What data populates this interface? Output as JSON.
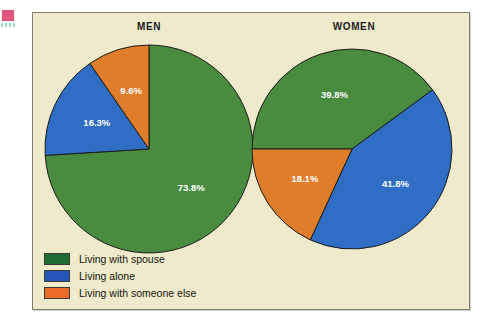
{
  "artifacts": {
    "pink_mark_color": "#e2567d",
    "teal_dash_color": "#93cfc4"
  },
  "panel": {
    "background_color": "#eeeacb",
    "border_color": "#7d7f72"
  },
  "colors": {
    "spouse_green": "#4a8c3f",
    "alone_blue": "#2f6ec4",
    "someone_else_orange": "#e07d2a",
    "legend_spouse_green": "#1e6b34",
    "legend_alone_blue": "#2356b8",
    "legend_someone_else_orange": "#ea6a2a",
    "slice_outline": "#1b1b1b",
    "label_text": "#ffffff"
  },
  "legend": {
    "items": [
      {
        "label": "Living with spouse",
        "color": "#1e6b34"
      },
      {
        "label": "Living alone",
        "color": "#2356b8"
      },
      {
        "label": "Living with someone else",
        "color": "#ea6a2a"
      }
    ]
  },
  "chart_data": [
    {
      "type": "pie",
      "title": "MEN",
      "categories": [
        "Living with spouse",
        "Living alone",
        "Living with someone else"
      ],
      "values": [
        73.8,
        16.3,
        9.6
      ],
      "labels": [
        "73.8%",
        "16.3%",
        "9.6%"
      ],
      "colors": [
        "#4a8c3f",
        "#2f6ec4",
        "#e07d2a"
      ],
      "start_angle_deg": 90,
      "direction": "clockwise",
      "units": "percent",
      "legend_position": "bottom-left"
    },
    {
      "type": "pie",
      "title": "WOMEN",
      "categories": [
        "Living with spouse",
        "Living alone",
        "Living with someone else"
      ],
      "values": [
        39.8,
        41.8,
        18.1
      ],
      "labels": [
        "39.8%",
        "41.8%",
        "18.1%"
      ],
      "colors": [
        "#4a8c3f",
        "#2f6ec4",
        "#e07d2a"
      ],
      "start_angle_deg": 180,
      "direction": "clockwise",
      "units": "percent",
      "legend_position": "bottom-left"
    }
  ]
}
